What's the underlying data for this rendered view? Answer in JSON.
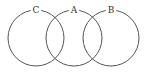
{
  "diagram": {
    "type": "venn",
    "sets": [
      {
        "id": "C",
        "label": "C",
        "cx": 36,
        "cy": 38,
        "r": 28
      },
      {
        "id": "A",
        "label": "A",
        "cx": 74,
        "cy": 38,
        "r": 28
      },
      {
        "id": "B",
        "label": "B",
        "cx": 111,
        "cy": 38,
        "r": 28
      }
    ],
    "colors": {
      "stroke": "#555555",
      "text": "#333333",
      "background": "#ffffff"
    }
  }
}
